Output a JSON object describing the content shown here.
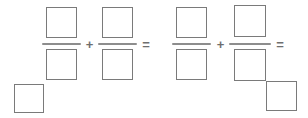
{
  "worksheet": {
    "type": "fraction-arithmetic-blank",
    "canvas": {
      "width": 308,
      "height": 118,
      "background": "#ffffff"
    },
    "colors": {
      "box_border": "#7a7a7a",
      "fraction_bar": "#8d8d8d",
      "operator": "#6e6e6e",
      "page_background": "#ffffff"
    },
    "expression_text": "□/□ + □/□ = □/□ + □/□ = ",
    "fractions": [
      {
        "index": 1,
        "numerator_value": "",
        "denominator_value": "",
        "numerator_box": {
          "x": 46,
          "y": 7,
          "w": 31,
          "h": 31
        },
        "denominator_box": {
          "x": 46,
          "y": 49,
          "w": 31,
          "h": 31
        },
        "bar": {
          "x": 42,
          "y": 43,
          "w": 39
        }
      },
      {
        "index": 2,
        "numerator_value": "",
        "denominator_value": "",
        "numerator_box": {
          "x": 102,
          "y": 7,
          "w": 31,
          "h": 31
        },
        "denominator_box": {
          "x": 102,
          "y": 49,
          "w": 31,
          "h": 31
        },
        "bar": {
          "x": 98,
          "y": 43,
          "w": 39
        }
      },
      {
        "index": 3,
        "numerator_value": "",
        "denominator_value": "",
        "numerator_box": {
          "x": 176,
          "y": 7,
          "w": 31,
          "h": 31
        },
        "denominator_box": {
          "x": 176,
          "y": 49,
          "w": 31,
          "h": 31
        },
        "bar": {
          "x": 172,
          "y": 43,
          "w": 39
        }
      },
      {
        "index": 4,
        "numerator_value": "",
        "denominator_value": "",
        "numerator_box": {
          "x": 234,
          "y": 5,
          "w": 32,
          "h": 32
        },
        "denominator_box": {
          "x": 234,
          "y": 49,
          "w": 32,
          "h": 32
        },
        "bar": {
          "x": 229,
          "y": 43,
          "w": 42
        }
      }
    ],
    "operators": [
      {
        "id": "plus-1",
        "symbol": "+",
        "x": 84,
        "y": 38,
        "w": 11,
        "h": 13
      },
      {
        "id": "equals-1",
        "symbol": "=",
        "x": 140,
        "y": 38,
        "w": 12,
        "h": 13
      },
      {
        "id": "plus-2",
        "symbol": "+",
        "x": 215,
        "y": 38,
        "w": 11,
        "h": 13
      },
      {
        "id": "equals-2",
        "symbol": "=",
        "x": 274,
        "y": 38,
        "w": 12,
        "h": 13
      }
    ],
    "answer_boxes": [
      {
        "id": "answer-left",
        "value": "",
        "x": 14,
        "y": 84,
        "w": 30,
        "h": 29
      },
      {
        "id": "answer-right",
        "value": "",
        "x": 266,
        "y": 81,
        "w": 31,
        "h": 30
      }
    ]
  }
}
